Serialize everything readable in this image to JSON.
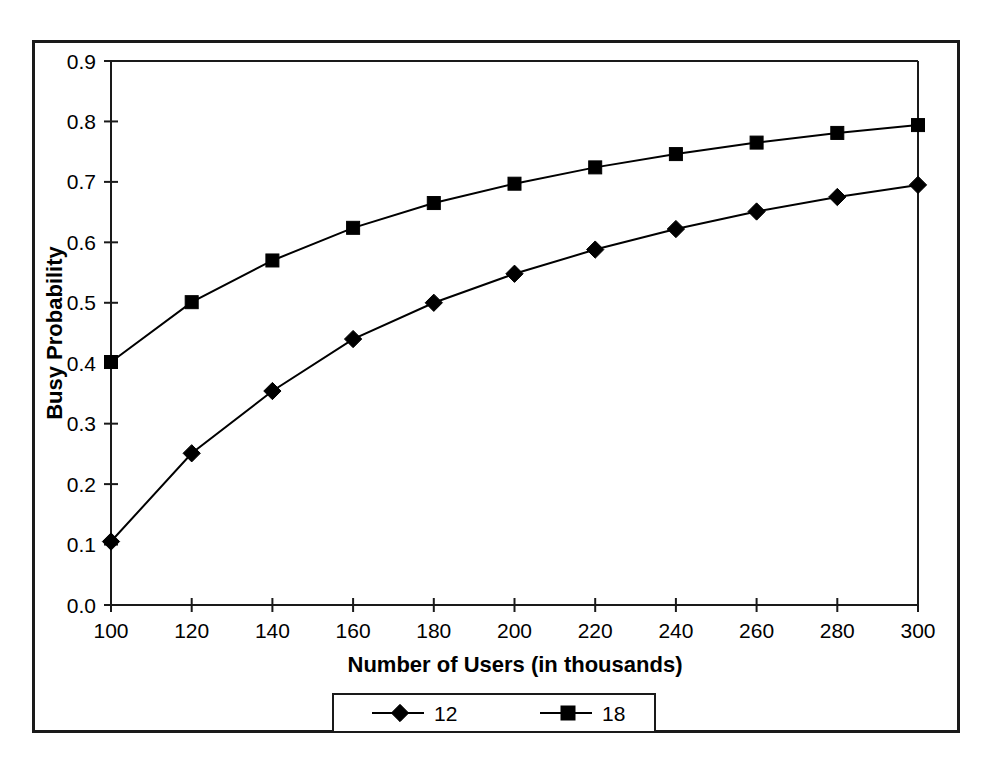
{
  "chart_data": {
    "type": "line",
    "title": "",
    "xlabel": "Number of Users (in thousands)",
    "ylabel": "Busy Probability",
    "x": [
      100,
      120,
      140,
      160,
      180,
      200,
      220,
      240,
      260,
      280,
      300
    ],
    "xlim": [
      100,
      300
    ],
    "ylim": [
      0.0,
      0.9
    ],
    "xticks": [
      "100",
      "120",
      "140",
      "160",
      "180",
      "200",
      "220",
      "240",
      "260",
      "280",
      "300"
    ],
    "yticks": [
      "0.0",
      "0.1",
      "0.2",
      "0.3",
      "0.4",
      "0.5",
      "0.6",
      "0.7",
      "0.8",
      "0.9"
    ],
    "grid": false,
    "legend_position": "below-plot",
    "series": [
      {
        "name": "12",
        "marker": "diamond",
        "color": "#000000",
        "values": [
          0.105,
          0.251,
          0.354,
          0.44,
          0.5,
          0.548,
          0.588,
          0.622,
          0.651,
          0.675,
          0.695
        ]
      },
      {
        "name": "18",
        "marker": "square",
        "color": "#000000",
        "values": [
          0.402,
          0.501,
          0.57,
          0.624,
          0.665,
          0.697,
          0.724,
          0.746,
          0.765,
          0.781,
          0.794
        ]
      }
    ]
  },
  "figure": {
    "border_color": "#1a1a1a",
    "background": "#ffffff",
    "axis_color": "#1a1a1a"
  },
  "legend": {
    "entries": [
      {
        "label": "12",
        "marker": "diamond-marker-icon"
      },
      {
        "label": "18",
        "marker": "square-marker-icon"
      }
    ]
  }
}
